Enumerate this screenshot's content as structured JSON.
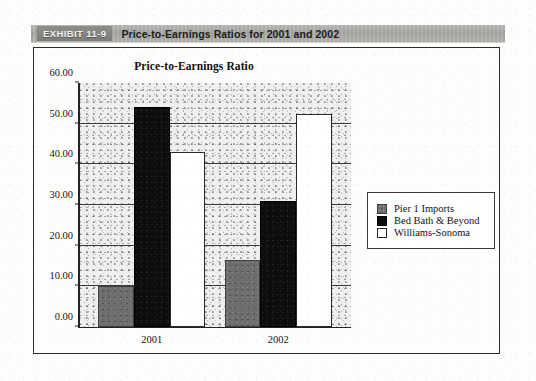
{
  "exhibit": {
    "tag": "EXHIBIT 11-9",
    "caption": "Price-to-Earnings Ratios for 2001 and 2002"
  },
  "chart_data": {
    "type": "bar",
    "title": "Price-to-Earnings Ratio",
    "xlabel": "",
    "ylabel": "",
    "categories": [
      "2001",
      "2002"
    ],
    "series": [
      {
        "name": "Pier 1 Imports",
        "color": "#6e6e6e",
        "values": [
          10.0,
          16.5
        ]
      },
      {
        "name": "Bed Bath & Beyond",
        "color": "#0d0d0d",
        "values": [
          54.0,
          31.0
        ]
      },
      {
        "name": "Williams-Sonoma",
        "color": "#ffffff",
        "values": [
          43.0,
          52.5
        ]
      }
    ],
    "ylim": [
      0,
      60
    ],
    "ytick_step": 10,
    "ytick_labels": [
      "60.00",
      "50.00",
      "40.00",
      "30.00",
      "20.00",
      "10.00",
      "0.00"
    ],
    "ytick_values": [
      60,
      50,
      40,
      30,
      20,
      10,
      0
    ],
    "grid": true,
    "legend_position": "right"
  }
}
